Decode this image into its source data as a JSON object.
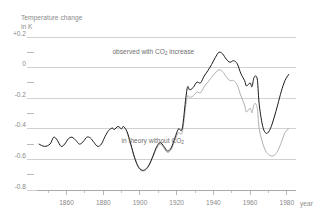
{
  "chart_data": {
    "type": "line",
    "title": "",
    "ylabel_line1": "Temperature change",
    "ylabel_line2": "in K",
    "xlabel": "year",
    "xlim": [
      1845,
      1985
    ],
    "ylim": [
      -0.8,
      0.2
    ],
    "grid": true,
    "legend_position": "inline-annotation",
    "ytick_labels": [
      "+0.2",
      "0",
      "-0.2",
      "-0.4",
      "-0.6",
      "-0.8"
    ],
    "ytick_values": [
      0.2,
      0.0,
      -0.2,
      -0.4,
      -0.6,
      -0.8
    ],
    "yminor_values": [
      0.1,
      -0.1,
      -0.3,
      -0.5,
      -0.7
    ],
    "xtick_labels": [
      "1860",
      "1880",
      "1900",
      "1920",
      "1940",
      "1960",
      "1980"
    ],
    "xtick_values": [
      1860,
      1880,
      1900,
      1920,
      1940,
      1960,
      1980
    ],
    "xminor_values": [
      1850,
      1870,
      1890,
      1910,
      1930,
      1950,
      1970
    ],
    "annotations": [
      {
        "id": "observed",
        "text_main": "observed with CO",
        "text_sub": "2",
        "text_tail": " increase",
        "x": 1885,
        "y": 0.09
      },
      {
        "id": "theory",
        "text_main": "in theory without CO",
        "text_sub": "2",
        "text_tail": "",
        "x": 1890,
        "y": -0.49
      }
    ],
    "series": [
      {
        "name": "observed with CO2 increase",
        "color": "#1a1a1a",
        "points": [
          [
            1845,
            -0.5
          ],
          [
            1848,
            -0.515
          ],
          [
            1851,
            -0.5
          ],
          [
            1853,
            -0.455
          ],
          [
            1855,
            -0.475
          ],
          [
            1857,
            -0.515
          ],
          [
            1859,
            -0.5
          ],
          [
            1861,
            -0.465
          ],
          [
            1863,
            -0.455
          ],
          [
            1865,
            -0.475
          ],
          [
            1867,
            -0.5
          ],
          [
            1869,
            -0.485
          ],
          [
            1871,
            -0.455
          ],
          [
            1873,
            -0.46
          ],
          [
            1875,
            -0.49
          ],
          [
            1877,
            -0.515
          ],
          [
            1879,
            -0.5
          ],
          [
            1881,
            -0.45
          ],
          [
            1883,
            -0.41
          ],
          [
            1885,
            -0.395
          ],
          [
            1886,
            -0.405
          ],
          [
            1888,
            -0.385
          ],
          [
            1890,
            -0.4
          ],
          [
            1891,
            -0.385
          ],
          [
            1893,
            -0.42
          ],
          [
            1895,
            -0.5
          ],
          [
            1897,
            -0.585
          ],
          [
            1899,
            -0.645
          ],
          [
            1901,
            -0.67
          ],
          [
            1903,
            -0.665
          ],
          [
            1905,
            -0.635
          ],
          [
            1907,
            -0.58
          ],
          [
            1909,
            -0.52
          ],
          [
            1911,
            -0.49
          ],
          [
            1913,
            -0.515
          ],
          [
            1915,
            -0.545
          ],
          [
            1917,
            -0.525
          ],
          [
            1919,
            -0.46
          ],
          [
            1921,
            -0.4
          ],
          [
            1923,
            -0.4
          ],
          [
            1925,
            -0.195
          ],
          [
            1926,
            -0.125
          ],
          [
            1927,
            -0.145
          ],
          [
            1929,
            -0.13
          ],
          [
            1931,
            -0.095
          ],
          [
            1933,
            -0.1
          ],
          [
            1935,
            -0.055
          ],
          [
            1937,
            -0.02
          ],
          [
            1939,
            0.02
          ],
          [
            1941,
            0.065
          ],
          [
            1943,
            0.1
          ],
          [
            1945,
            0.09
          ],
          [
            1947,
            0.055
          ],
          [
            1949,
            0.035
          ],
          [
            1951,
            0.045
          ],
          [
            1953,
            0.025
          ],
          [
            1955,
            -0.04
          ],
          [
            1957,
            -0.085
          ],
          [
            1958,
            -0.12
          ],
          [
            1960,
            -0.1
          ],
          [
            1961,
            -0.125
          ],
          [
            1962,
            -0.07
          ],
          [
            1963,
            -0.055
          ],
          [
            1964,
            -0.085
          ],
          [
            1965,
            -0.245
          ],
          [
            1967,
            -0.39
          ],
          [
            1969,
            -0.43
          ],
          [
            1971,
            -0.4
          ],
          [
            1973,
            -0.33
          ],
          [
            1975,
            -0.245
          ],
          [
            1977,
            -0.155
          ],
          [
            1979,
            -0.085
          ],
          [
            1981,
            -0.045
          ]
        ]
      },
      {
        "name": "in theory without CO2",
        "color": "#b0b0b0",
        "points": [
          [
            1893,
            -0.425
          ],
          [
            1895,
            -0.505
          ],
          [
            1897,
            -0.59
          ],
          [
            1899,
            -0.65
          ],
          [
            1901,
            -0.675
          ],
          [
            1903,
            -0.67
          ],
          [
            1905,
            -0.64
          ],
          [
            1907,
            -0.585
          ],
          [
            1909,
            -0.53
          ],
          [
            1911,
            -0.5
          ],
          [
            1913,
            -0.525
          ],
          [
            1915,
            -0.555
          ],
          [
            1917,
            -0.535
          ],
          [
            1919,
            -0.475
          ],
          [
            1921,
            -0.425
          ],
          [
            1923,
            -0.425
          ],
          [
            1925,
            -0.245
          ],
          [
            1926,
            -0.185
          ],
          [
            1927,
            -0.195
          ],
          [
            1929,
            -0.185
          ],
          [
            1931,
            -0.16
          ],
          [
            1933,
            -0.165
          ],
          [
            1935,
            -0.125
          ],
          [
            1937,
            -0.095
          ],
          [
            1939,
            -0.065
          ],
          [
            1941,
            -0.035
          ],
          [
            1943,
            -0.015
          ],
          [
            1945,
            -0.025
          ],
          [
            1947,
            -0.06
          ],
          [
            1949,
            -0.085
          ],
          [
            1951,
            -0.085
          ],
          [
            1953,
            -0.115
          ],
          [
            1955,
            -0.185
          ],
          [
            1957,
            -0.245
          ],
          [
            1958,
            -0.29
          ],
          [
            1960,
            -0.265
          ],
          [
            1961,
            -0.295
          ],
          [
            1962,
            -0.245
          ],
          [
            1963,
            -0.235
          ],
          [
            1964,
            -0.275
          ],
          [
            1965,
            -0.4
          ],
          [
            1967,
            -0.5
          ],
          [
            1969,
            -0.555
          ],
          [
            1971,
            -0.575
          ],
          [
            1973,
            -0.575
          ],
          [
            1975,
            -0.545
          ],
          [
            1977,
            -0.49
          ],
          [
            1979,
            -0.425
          ],
          [
            1981,
            -0.4
          ]
        ]
      }
    ]
  }
}
